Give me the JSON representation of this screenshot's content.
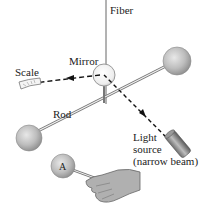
{
  "diagram": {
    "labels": {
      "fiber": "Fiber",
      "mirror": "Mirror",
      "scale": "Scale",
      "rod": "Rod",
      "light_line1": "Light",
      "light_line2": "source",
      "light_line3": "(narrow beam)",
      "sphere_a": "A"
    },
    "colors": {
      "sphere_fill": "#b8b8b8",
      "sphere_highlight": "#e6e6e6",
      "line": "#555555",
      "beam": "#111111",
      "hand": "#a9a9a9",
      "light_source": "#8a8a8a"
    }
  }
}
